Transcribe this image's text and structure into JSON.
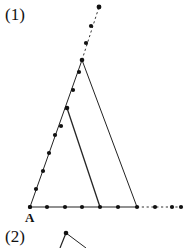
{
  "figure": {
    "part_one_label": "(1)",
    "part_two_label": "(2)",
    "vertex_a_label": "A",
    "stroke_color": "#222222",
    "dot_color": "#111111",
    "background_color": "#ffffff",
    "stroke_width": 1,
    "dot_radius": 2.1,
    "geometry": {
      "point_a": [
        30,
        207
      ],
      "large_apex": [
        82,
        60
      ],
      "large_base_right": [
        137,
        207
      ],
      "inner_apex": [
        67,
        108
      ],
      "inner_base_right": [
        100,
        207
      ],
      "baseline_solid": [
        [
          30,
          207
        ],
        [
          137,
          207
        ]
      ],
      "baseline_dashed": [
        [
          137,
          207
        ],
        [
          182,
          207
        ]
      ],
      "apex_ray_dashed": [
        [
          82,
          60
        ],
        [
          99,
          7
        ]
      ],
      "left_side_dots": [
        [
          30,
          207
        ],
        [
          36,
          189
        ],
        [
          43,
          171
        ],
        [
          49,
          153
        ],
        [
          55,
          135
        ],
        [
          61,
          126
        ],
        [
          67,
          108
        ],
        [
          73,
          90
        ],
        [
          79,
          72
        ],
        [
          82,
          60
        ]
      ],
      "baseline_dots": [
        [
          30,
          207
        ],
        [
          47,
          207
        ],
        [
          65,
          207
        ],
        [
          82,
          207
        ],
        [
          100,
          207
        ],
        [
          118,
          207
        ],
        [
          137,
          207
        ],
        [
          155,
          207
        ],
        [
          172,
          207
        ],
        [
          181,
          207
        ]
      ],
      "apex_ray_dots": [
        [
          82,
          60
        ],
        [
          86,
          43
        ],
        [
          91,
          26
        ],
        [
          99,
          7
        ]
      ],
      "part_two_shape": {
        "apex": [
          66,
          233
        ],
        "left_leg_end": [
          60,
          248
        ],
        "right_leg_end": [
          86,
          248
        ]
      }
    }
  }
}
